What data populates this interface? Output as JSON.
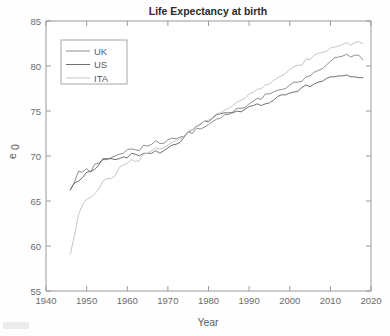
{
  "figure": {
    "title": "Life Expectancy at birth",
    "background_color": "#fefefe",
    "axis_color": "#9a9a9a"
  },
  "axes": {
    "x": {
      "label": "Year",
      "ticks": [
        "1940",
        "1950",
        "1960",
        "1970",
        "1980",
        "1990",
        "2000",
        "2010",
        "2020"
      ],
      "min": 1940,
      "max": 2020,
      "step": 10
    },
    "y": {
      "label": "e",
      "label_subscript": "0",
      "ticks": [
        "55",
        "60",
        "65",
        "70",
        "75",
        "80",
        "85"
      ],
      "min": 55,
      "max": 85,
      "step": 5
    }
  },
  "legend": {
    "position": "upper-left",
    "entries": [
      {
        "label": "UK",
        "color": "#8f8f8f"
      },
      {
        "label": "US",
        "color": "#6f6f6f"
      },
      {
        "label": "ITA",
        "color": "#c6c6c6"
      }
    ]
  },
  "chart_data": {
    "type": "line",
    "title": "Life Expectancy at birth",
    "xlabel": "Year",
    "ylabel": "e_0",
    "xlim": [
      1940,
      2020
    ],
    "ylim": [
      55,
      85
    ],
    "grid": false,
    "legend_position": "upper-left",
    "x": [
      1946,
      1947,
      1948,
      1949,
      1950,
      1951,
      1952,
      1953,
      1954,
      1955,
      1956,
      1957,
      1958,
      1959,
      1960,
      1961,
      1962,
      1963,
      1964,
      1965,
      1966,
      1967,
      1968,
      1969,
      1970,
      1971,
      1972,
      1973,
      1974,
      1975,
      1976,
      1977,
      1978,
      1979,
      1980,
      1981,
      1982,
      1983,
      1984,
      1985,
      1986,
      1987,
      1988,
      1989,
      1990,
      1991,
      1992,
      1993,
      1994,
      1995,
      1996,
      1997,
      1998,
      1999,
      2000,
      2001,
      2002,
      2003,
      2004,
      2005,
      2006,
      2007,
      2008,
      2009,
      2010,
      2011,
      2012,
      2013,
      2014,
      2015,
      2016,
      2017,
      2018
    ],
    "series": [
      {
        "name": "UK",
        "color": "#8f8f8f",
        "values": [
          66.2,
          67.1,
          68.3,
          68.2,
          68.6,
          68.2,
          69.1,
          69.2,
          69.6,
          69.6,
          69.8,
          70.0,
          70.2,
          70.3,
          70.7,
          70.8,
          70.7,
          70.6,
          71.2,
          71.1,
          71.3,
          71.7,
          71.4,
          71.4,
          71.8,
          72.0,
          71.9,
          72.1,
          72.2,
          72.7,
          72.5,
          73.1,
          73.0,
          73.2,
          73.5,
          73.8,
          74.1,
          74.2,
          74.6,
          74.6,
          74.9,
          75.3,
          75.3,
          75.4,
          75.8,
          76.1,
          76.4,
          76.3,
          76.9,
          76.9,
          77.1,
          77.3,
          77.4,
          77.5,
          77.9,
          78.2,
          78.2,
          78.3,
          78.8,
          78.9,
          79.3,
          79.5,
          79.7,
          80.1,
          80.5,
          80.9,
          81.0,
          81.1,
          81.3,
          81.0,
          81.2,
          81.2,
          80.7
        ]
      },
      {
        "name": "US",
        "color": "#6f6f6f",
        "values": [
          66.3,
          67.0,
          67.2,
          67.6,
          68.2,
          68.3,
          68.5,
          69.0,
          69.7,
          69.7,
          69.7,
          69.6,
          69.7,
          69.9,
          69.8,
          70.3,
          70.2,
          70.0,
          70.3,
          70.3,
          70.3,
          70.6,
          70.3,
          70.6,
          70.9,
          71.2,
          71.3,
          71.5,
          72.1,
          72.7,
          72.9,
          73.3,
          73.5,
          73.9,
          73.8,
          74.2,
          74.6,
          74.7,
          74.8,
          74.8,
          74.8,
          75.0,
          74.9,
          75.2,
          75.5,
          75.6,
          75.8,
          75.6,
          75.8,
          75.9,
          76.2,
          76.6,
          76.8,
          76.8,
          77.0,
          77.1,
          77.2,
          77.6,
          77.9,
          77.7,
          78.0,
          78.2,
          78.3,
          78.6,
          78.8,
          78.8,
          78.9,
          78.9,
          79.0,
          78.8,
          78.8,
          78.7,
          78.7
        ]
      },
      {
        "name": "ITA",
        "color": "#c6c6c6",
        "values": [
          59.1,
          61.2,
          63.5,
          64.6,
          65.2,
          65.4,
          65.8,
          66.3,
          67.2,
          67.5,
          67.5,
          67.8,
          68.7,
          69.0,
          69.2,
          69.6,
          69.4,
          69.5,
          70.2,
          70.3,
          70.6,
          70.9,
          70.8,
          70.9,
          71.2,
          71.5,
          71.7,
          71.9,
          72.2,
          72.6,
          72.9,
          73.3,
          73.6,
          73.9,
          74.0,
          74.3,
          74.7,
          74.8,
          75.1,
          75.3,
          75.6,
          76.0,
          76.2,
          76.4,
          76.9,
          77.1,
          77.4,
          77.5,
          77.9,
          78.0,
          78.4,
          78.7,
          78.9,
          79.2,
          79.6,
          79.9,
          80.1,
          80.1,
          80.8,
          80.7,
          81.2,
          81.4,
          81.5,
          81.6,
          82.0,
          82.1,
          82.2,
          82.4,
          82.6,
          82.3,
          82.6,
          82.7,
          82.5
        ]
      }
    ]
  }
}
